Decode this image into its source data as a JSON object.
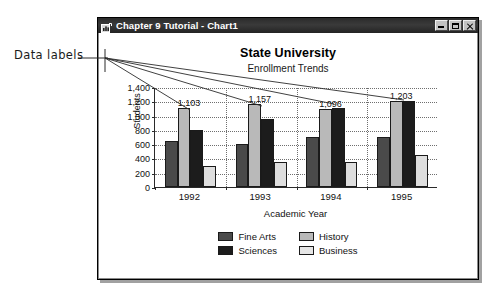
{
  "annotation": {
    "label": "Data labels"
  },
  "window": {
    "title": "Chapter 9 Tutorial - Chart1",
    "icon": "chart-document-icon",
    "buttons": {
      "minimize": "Minimize",
      "maximize": "Maximize",
      "close": "Close"
    }
  },
  "legend": {
    "items": [
      {
        "label": "Fine Arts",
        "swatch": "s0"
      },
      {
        "label": "History",
        "swatch": "s2"
      },
      {
        "label": "Sciences",
        "swatch": "s1"
      },
      {
        "label": "Business",
        "swatch": "s3"
      }
    ]
  },
  "chart_data": {
    "type": "bar",
    "title": "State University",
    "subtitle": "Enrollment Trends",
    "xlabel": "Academic Year",
    "ylabel": "Students",
    "categories": [
      "1992",
      "1993",
      "1994",
      "1995"
    ],
    "series": [
      {
        "name": "Fine Arts",
        "color": "#4a4a4a",
        "values": [
          650,
          600,
          700,
          700
        ]
      },
      {
        "name": "Sciences",
        "color": "#b9b9b9",
        "values": [
          1103,
          1157,
          1096,
          1203
        ]
      },
      {
        "name": "History",
        "color": "#1c1c1c",
        "values": [
          800,
          950,
          1100,
          1200
        ]
      },
      {
        "name": "Business",
        "color": "#dedede",
        "values": [
          300,
          350,
          350,
          450
        ]
      }
    ],
    "data_labels": [
      {
        "category": "1992",
        "series": "Sciences",
        "text": "1,103"
      },
      {
        "category": "1993",
        "series": "Sciences",
        "text": "1,157"
      },
      {
        "category": "1994",
        "series": "Sciences",
        "text": "1,096"
      },
      {
        "category": "1995",
        "series": "Sciences",
        "text": "1,203"
      }
    ],
    "ylim": [
      0,
      1400
    ],
    "yticks": [
      0,
      200,
      400,
      600,
      800,
      1000,
      1200,
      1400
    ],
    "ytick_labels": [
      "0",
      "200",
      "400",
      "600",
      "800",
      "1,000",
      "1,200",
      "1,400"
    ],
    "grid": true,
    "legend_position": "bottom"
  }
}
